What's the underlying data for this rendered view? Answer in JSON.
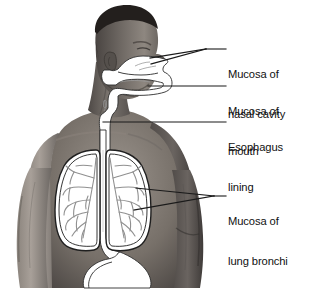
{
  "figure": {
    "background_color": "#ffffff",
    "line_color": "#1a1a1a",
    "overlay_fill": "#ffffff",
    "bronchi_color": "#8a8a8a",
    "photo_tone_dark": "#3a3734",
    "photo_tone_mid": "#6f6a66",
    "photo_tone_light": "#b6b0aa"
  },
  "labels": [
    {
      "id": "nasal-cavity",
      "line1": "Mucosa of",
      "line2": "nasal cavity",
      "text_x": 228,
      "text_y": 42,
      "leaders": [
        {
          "x1": 226,
          "y1": 49,
          "x2": 206,
          "y2": 49
        },
        {
          "x1": 206,
          "y1": 49,
          "x2": 150,
          "y2": 58
        },
        {
          "x1": 206,
          "y1": 49,
          "x2": 151,
          "y2": 64
        }
      ]
    },
    {
      "id": "mouth",
      "line1": "Mucosa of",
      "line2": "mouth",
      "text_x": 228,
      "text_y": 81,
      "leaders": [
        {
          "x1": 226,
          "y1": 86,
          "x2": 148,
          "y2": 86
        }
      ]
    },
    {
      "id": "esophagus",
      "line1": "Esophagus",
      "line2": "lining",
      "text_x": 228,
      "text_y": 117,
      "leaders": [
        {
          "x1": 226,
          "y1": 122,
          "x2": 103,
          "y2": 122
        }
      ]
    },
    {
      "id": "lung-bronchi",
      "line1": "Mucosa of",
      "line2": "lung bronchi",
      "text_x": 228,
      "text_y": 189,
      "leaders": [
        {
          "x1": 226,
          "y1": 196,
          "x2": 214,
          "y2": 196
        },
        {
          "x1": 214,
          "y1": 196,
          "x2": 136,
          "y2": 188
        },
        {
          "x1": 214,
          "y1": 196,
          "x2": 134,
          "y2": 210
        }
      ]
    }
  ],
  "photo": {
    "left": 15,
    "top": 4,
    "right": 213,
    "bottom": 288
  }
}
